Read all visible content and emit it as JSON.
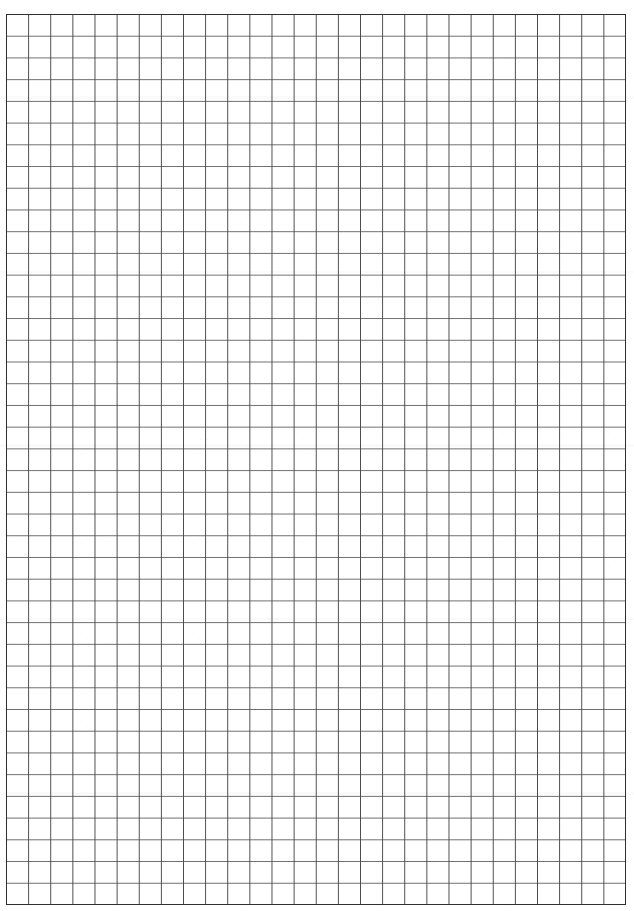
{
  "document": {
    "type": "grid-paper-scan",
    "title": "Blank graph paper sheet",
    "page_background": "#ffffff",
    "page_width": 634,
    "page_height": 911,
    "visible_text": "",
    "annotations": []
  },
  "chart_data": {
    "type": "table",
    "title": "",
    "xlabel": "",
    "ylabel": "",
    "grid": true,
    "legend": "none",
    "categories": [],
    "values": []
  },
  "grid": {
    "origin_x": 6,
    "origin_y": 14,
    "right": 626,
    "bottom": 905,
    "width": 620,
    "height": 891,
    "columns": 28,
    "rows": 41,
    "cell_width": 22.14,
    "cell_height": 21.73,
    "line_color": "#4a4a4a",
    "line_color_soft": "#6e6e6e",
    "border_color": "#2f2f2f",
    "line_width": 1,
    "border_width": 1.4,
    "subdivisions": 0
  },
  "margins": {
    "top": 14,
    "left": 6,
    "right": 8,
    "bottom": 6
  },
  "scan": {
    "bands": [
      {
        "top": 96,
        "height": 3
      },
      {
        "top": 271,
        "height": 2
      },
      {
        "top": 444,
        "height": 3
      },
      {
        "top": 618,
        "height": 2
      },
      {
        "top": 792,
        "height": 3
      }
    ]
  }
}
